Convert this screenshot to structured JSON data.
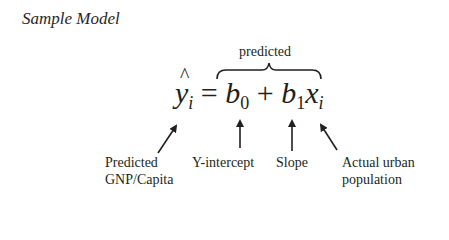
{
  "title": "Sample Model",
  "brace_label": "predicted",
  "formula": {
    "lhs_var": "y",
    "lhs_sub": "i",
    "equals": "=",
    "b0_var": "b",
    "b0_sub": "0",
    "plus": "+",
    "b1_var": "b",
    "b1_sub": "1",
    "x_var": "x",
    "x_sub": "i"
  },
  "annotations": [
    {
      "line1": "Predicted",
      "line2": "GNP/Capita",
      "points_to": "y-hat-i",
      "icon": "arrow-up-right-icon"
    },
    {
      "line1": "Y-intercept",
      "line2": "",
      "points_to": "b0",
      "icon": "arrow-up-icon"
    },
    {
      "line1": "Slope",
      "line2": "",
      "points_to": "b1",
      "icon": "arrow-up-icon"
    },
    {
      "line1": "Actual urban",
      "line2": "population",
      "points_to": "x-i",
      "icon": "arrow-up-left-icon"
    }
  ]
}
